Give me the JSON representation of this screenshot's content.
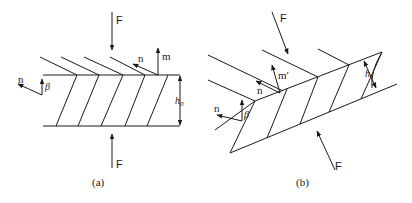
{
  "figure": {
    "panels": [
      {
        "id": "a",
        "caption": "(a)",
        "labels": {
          "force_top": "F",
          "force_bottom": "F",
          "m_vector": "m",
          "n_vector_top": "n",
          "n_vector_left": "n",
          "beta": "β",
          "thickness": "h",
          "thickness_sub": "0"
        }
      },
      {
        "id": "b",
        "caption": "(b)",
        "labels": {
          "force_top": "F",
          "force_bottom": "F",
          "m_vector": "m′",
          "n_vector_top": "n",
          "n_vector_left": "n",
          "beta": "β",
          "thickness": "h"
        }
      }
    ]
  }
}
